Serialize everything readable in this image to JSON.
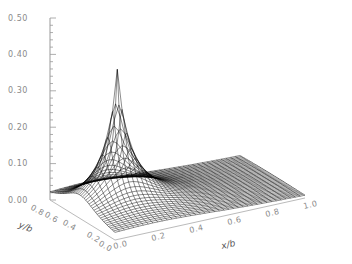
{
  "chart_data": {
    "type": "surface",
    "title": "",
    "xlabel": "x/b",
    "ylabel": "y/b",
    "zlabel": "",
    "x_ticks": [
      "0.0",
      "0.2",
      "0.4",
      "0.6",
      "0.8",
      "1.0"
    ],
    "y_ticks": [
      "0.0",
      "0.2",
      "0.4",
      "0.6",
      "0.8"
    ],
    "z_ticks": [
      "0.00",
      "0.10",
      "0.20",
      "0.30",
      "0.40",
      "0.50"
    ],
    "xlim": [
      0,
      1.0
    ],
    "ylim": [
      0,
      1.0
    ],
    "zlim": [
      0,
      0.5
    ],
    "peak": {
      "x": 0.0,
      "y": 0.0,
      "z": 0.42
    },
    "grid": false,
    "line_color": "#000000"
  }
}
